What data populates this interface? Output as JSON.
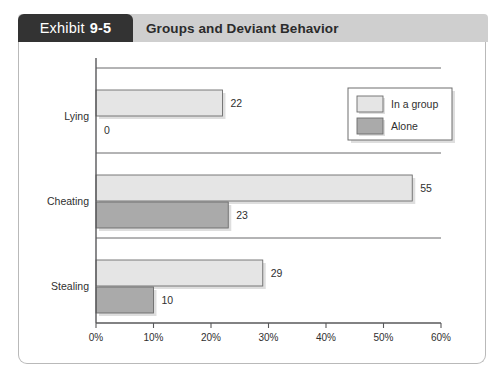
{
  "header": {
    "exhibit_word": "Exhibit",
    "exhibit_number": "9-5",
    "title": "Groups and Deviant Behavior"
  },
  "chart_data": {
    "type": "bar",
    "orientation": "horizontal",
    "title": "Groups and Deviant Behavior",
    "categories": [
      "Lying",
      "Cheating",
      "Stealing"
    ],
    "series": [
      {
        "name": "In a group",
        "values": [
          22,
          55,
          29
        ],
        "color": "#e5e5e5"
      },
      {
        "name": "Alone",
        "values": [
          0,
          23,
          10
        ],
        "color": "#aaaaaa"
      }
    ],
    "xlabel": "",
    "ylabel": "",
    "xlim": [
      0,
      60
    ],
    "xticks": [
      0,
      10,
      20,
      30,
      40,
      50,
      60
    ],
    "xtick_labels": [
      "0%",
      "10%",
      "20%",
      "30%",
      "40%",
      "50%",
      "60%"
    ],
    "grid": true,
    "grid_axis": "y",
    "legend_position": "top-right",
    "value_labels": [
      "22",
      "0",
      "55",
      "23",
      "29",
      "10"
    ]
  }
}
